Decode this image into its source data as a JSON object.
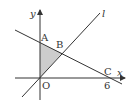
{
  "diagram": {
    "axes": {
      "x_label": "x",
      "y_label": "y"
    },
    "line_label": "l",
    "points": {
      "origin": "O",
      "A": "A",
      "B": "B",
      "C": "C"
    },
    "tick_labels": {
      "x_tick": "6"
    },
    "colors": {
      "stroke": "#333333",
      "shade": "#cccccc"
    }
  }
}
